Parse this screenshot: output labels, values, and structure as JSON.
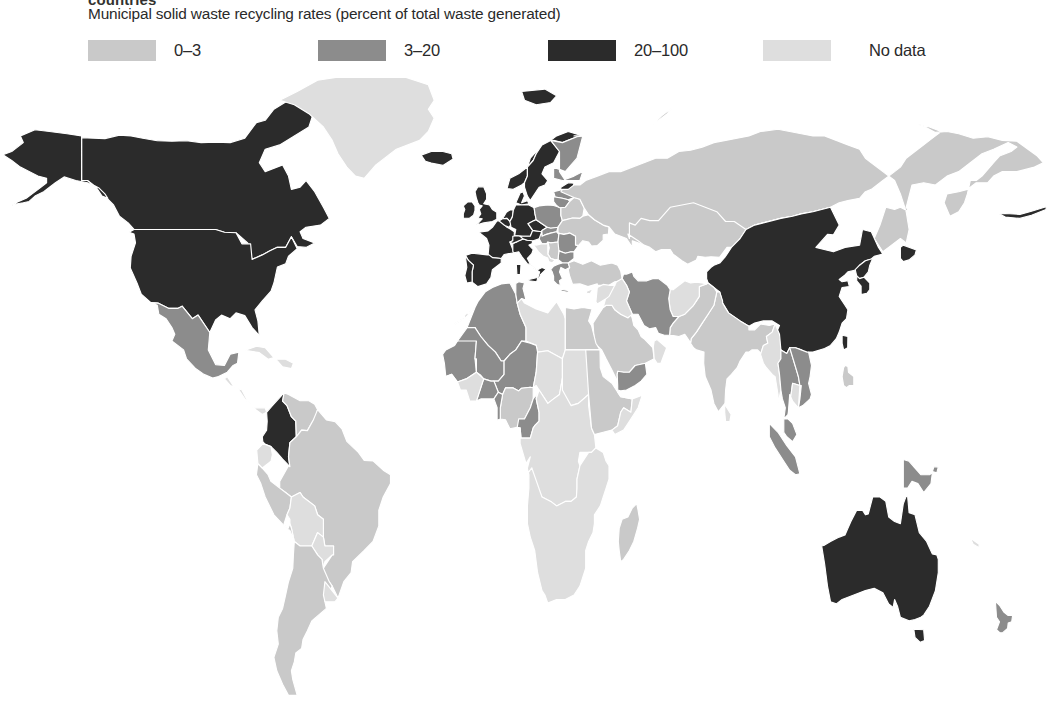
{
  "header": {
    "title": "countries",
    "subtitle": "Municipal solid waste recycling rates (percent of total waste generated)"
  },
  "legend": {
    "items": [
      {
        "label": "0–3",
        "color": "#c9c9c9",
        "key": "low"
      },
      {
        "label": "3–20",
        "color": "#8c8c8c",
        "key": "mid"
      },
      {
        "label": "20–100",
        "color": "#2b2b2b",
        "key": "high"
      },
      {
        "label": "No data",
        "color": "#dedede",
        "key": "nodata"
      }
    ]
  },
  "colors": {
    "low": "#c9c9c9",
    "mid": "#8c8c8c",
    "high": "#2b2b2b",
    "nodata": "#dedede",
    "ocean": "#ffffff",
    "border": "#ffffff",
    "text": "#2a2a2a"
  },
  "chart_data": {
    "type": "choropleth",
    "title": "Municipal solid waste recycling rates (percent of total waste generated)",
    "unit": "percent of total waste generated",
    "projection": "equirectangular",
    "legend_position": "top",
    "bins": [
      {
        "label": "0–3",
        "min": 0,
        "max": 3,
        "color": "#c9c9c9"
      },
      {
        "label": "3–20",
        "min": 3,
        "max": 20,
        "color": "#8c8c8c"
      },
      {
        "label": "20–100",
        "min": 20,
        "max": 100,
        "color": "#2b2b2b"
      },
      {
        "label": "No data",
        "min": null,
        "max": null,
        "color": "#dedede"
      }
    ],
    "regions": [
      {
        "name": "United States",
        "bin": "20–100"
      },
      {
        "name": "Canada",
        "bin": "20–100"
      },
      {
        "name": "Mexico",
        "bin": "3–20"
      },
      {
        "name": "Greenland",
        "bin": "No data"
      },
      {
        "name": "Iceland",
        "bin": "20–100"
      },
      {
        "name": "Norway",
        "bin": "20–100"
      },
      {
        "name": "Sweden",
        "bin": "20–100"
      },
      {
        "name": "Finland",
        "bin": "3–20"
      },
      {
        "name": "Denmark",
        "bin": "20–100"
      },
      {
        "name": "United Kingdom",
        "bin": "20–100"
      },
      {
        "name": "Ireland",
        "bin": "20–100"
      },
      {
        "name": "Netherlands",
        "bin": "20–100"
      },
      {
        "name": "Belgium",
        "bin": "20–100"
      },
      {
        "name": "Germany",
        "bin": "20–100"
      },
      {
        "name": "France",
        "bin": "20–100"
      },
      {
        "name": "Spain",
        "bin": "20–100"
      },
      {
        "name": "Portugal",
        "bin": "20–100"
      },
      {
        "name": "Italy",
        "bin": "20–100"
      },
      {
        "name": "Switzerland",
        "bin": "20–100"
      },
      {
        "name": "Austria",
        "bin": "20–100"
      },
      {
        "name": "Czechia",
        "bin": "20–100"
      },
      {
        "name": "Poland",
        "bin": "3–20"
      },
      {
        "name": "Estonia",
        "bin": "20–100"
      },
      {
        "name": "Latvia",
        "bin": "3–20"
      },
      {
        "name": "Lithuania",
        "bin": "3–20"
      },
      {
        "name": "Slovakia",
        "bin": "3–20"
      },
      {
        "name": "Hungary",
        "bin": "3–20"
      },
      {
        "name": "Romania",
        "bin": "3–20"
      },
      {
        "name": "Bulgaria",
        "bin": "3–20"
      },
      {
        "name": "Serbia",
        "bin": "0–3"
      },
      {
        "name": "Greece",
        "bin": "3–20"
      },
      {
        "name": "Turkey",
        "bin": "0–3"
      },
      {
        "name": "Ukraine",
        "bin": "0–3"
      },
      {
        "name": "Belarus",
        "bin": "0–3"
      },
      {
        "name": "Russia",
        "bin": "0–3"
      },
      {
        "name": "Kazakhstan",
        "bin": "0–3"
      },
      {
        "name": "China",
        "bin": "20–100"
      },
      {
        "name": "Japan",
        "bin": "20–100"
      },
      {
        "name": "South Korea",
        "bin": "20–100"
      },
      {
        "name": "North Korea",
        "bin": "20–100"
      },
      {
        "name": "Taiwan",
        "bin": "20–100"
      },
      {
        "name": "Mongolia",
        "bin": "0–3"
      },
      {
        "name": "India",
        "bin": "0–3"
      },
      {
        "name": "Pakistan",
        "bin": "0–3"
      },
      {
        "name": "Iran",
        "bin": "3–20"
      },
      {
        "name": "Saudi Arabia",
        "bin": "0–3"
      },
      {
        "name": "Yemen",
        "bin": "3–20"
      },
      {
        "name": "Thailand",
        "bin": "3–20"
      },
      {
        "name": "Vietnam",
        "bin": "3–20"
      },
      {
        "name": "Malaysia",
        "bin": "3–20"
      },
      {
        "name": "Indonesia",
        "bin": "3–20"
      },
      {
        "name": "Philippines",
        "bin": "0–3"
      },
      {
        "name": "Papua New Guinea",
        "bin": "3–20"
      },
      {
        "name": "Australia",
        "bin": "20–100"
      },
      {
        "name": "New Zealand",
        "bin": "3–20"
      },
      {
        "name": "Colombia",
        "bin": "20–100"
      },
      {
        "name": "French Guiana",
        "bin": "20–100"
      },
      {
        "name": "Brazil",
        "bin": "0–3"
      },
      {
        "name": "Argentina",
        "bin": "0–3"
      },
      {
        "name": "Chile",
        "bin": "0–3"
      },
      {
        "name": "Peru",
        "bin": "0–3"
      },
      {
        "name": "Venezuela",
        "bin": "0–3"
      },
      {
        "name": "Algeria",
        "bin": "3–20"
      },
      {
        "name": "Morocco",
        "bin": "3–20"
      },
      {
        "name": "Tunisia",
        "bin": "3–20"
      },
      {
        "name": "Mali",
        "bin": "3–20"
      },
      {
        "name": "Niger",
        "bin": "3–20"
      },
      {
        "name": "Mauritania",
        "bin": "3–20"
      },
      {
        "name": "Burkina Faso",
        "bin": "3–20"
      },
      {
        "name": "Benin",
        "bin": "3–20"
      },
      {
        "name": "Cameroon",
        "bin": "3–20"
      },
      {
        "name": "Egypt",
        "bin": "0–3"
      },
      {
        "name": "Nigeria",
        "bin": "0–3"
      },
      {
        "name": "Ethiopia",
        "bin": "0–3"
      },
      {
        "name": "South Africa",
        "bin": "0–3"
      },
      {
        "name": "Madagascar",
        "bin": "0–3"
      }
    ]
  }
}
